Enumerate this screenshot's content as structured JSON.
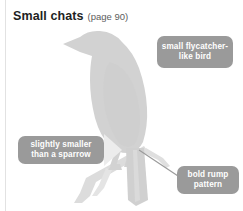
{
  "page": {
    "width": 243,
    "height": 211,
    "background_color": "#ffffff"
  },
  "heading": {
    "title": "Small chats",
    "page_reference": "(page 90)",
    "title_color": "#221f1f",
    "page_reference_color": "#5d5d5d"
  },
  "illustration": {
    "subject": "perched small chat bird silhouette on a branch",
    "silhouette_color": "#d2d2d2",
    "branch_color": "#dcdcdc",
    "leader_line_color": "#9a9a9a"
  },
  "callouts": [
    {
      "id": "flycatcher",
      "line1": "small flycatcher-",
      "line2": "like bird",
      "background_color": "#9a9a9a",
      "text_color": "#ffffff"
    },
    {
      "id": "sparrow",
      "line1": "slightly smaller",
      "line2": "than a sparrow",
      "background_color": "#9a9a9a",
      "text_color": "#ffffff"
    },
    {
      "id": "rump",
      "line1": "bold rump",
      "line2": "pattern",
      "background_color": "#9a9a9a",
      "text_color": "#ffffff"
    }
  ]
}
